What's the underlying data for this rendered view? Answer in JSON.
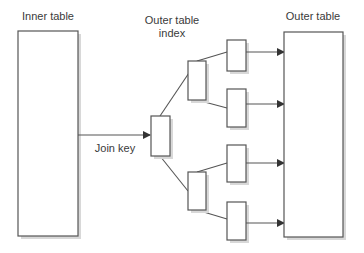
{
  "labels": {
    "inner_table": "Inner table",
    "outer_index_line1": "Outer table",
    "outer_index_line2": "index",
    "outer_table": "Outer table",
    "join_key": "Join key"
  },
  "colors": {
    "stroke": "#555555",
    "text": "#3a3a3a",
    "shadow": "#d8d8d8",
    "background": "#ffffff"
  }
}
